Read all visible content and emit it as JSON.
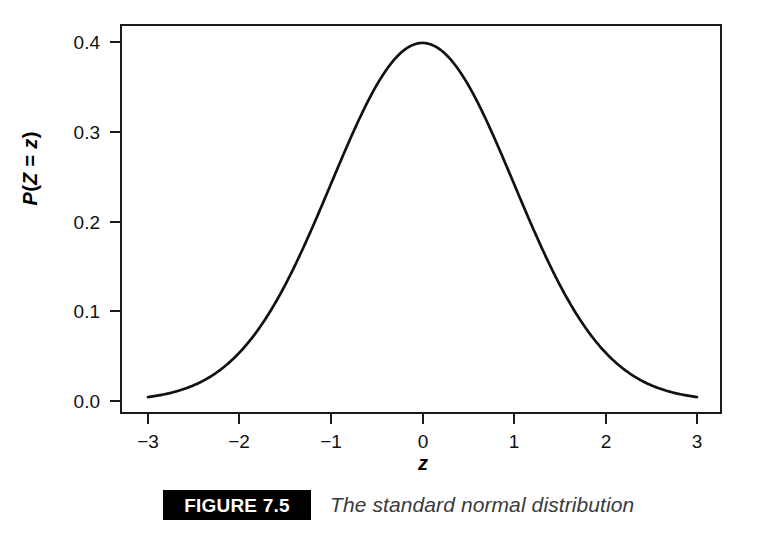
{
  "figure": {
    "badge_label": "FIGURE 7.5",
    "caption": "The standard normal distribution",
    "badge_bg_color": "#000000",
    "badge_text_color": "#ffffff",
    "caption_text_color": "#3b3b3b"
  },
  "axis_titles": {
    "y_parts": {
      "p": "P",
      "open": "(",
      "z_upper": "Z",
      "equals": " = ",
      "z_lower": "z",
      "close": ")"
    },
    "y_full": "P (Z = z)",
    "x": "z"
  },
  "ticks": {
    "y": [
      "0.4",
      "0.3",
      "0.2",
      "0.1",
      "0.0"
    ],
    "x": [
      "−3",
      "−2",
      "−1",
      "0",
      "1",
      "2",
      "3"
    ]
  },
  "chart_data": {
    "type": "line",
    "title": "",
    "subtitle": "",
    "xlabel": "z",
    "ylabel": "P (Z = z)",
    "xlim": [
      -3.25,
      3.25
    ],
    "ylim": [
      -0.013,
      0.4345
    ],
    "xticks": [
      -3,
      -2,
      -1,
      0,
      1,
      2,
      3
    ],
    "xticklabels": [
      "−3",
      "−2",
      "−1",
      "0",
      "1",
      "2",
      "3"
    ],
    "yticks": [
      0.0,
      0.1,
      0.2,
      0.3,
      0.4
    ],
    "yticklabels": [
      "0.0",
      "0.1",
      "0.2",
      "0.3",
      "0.4"
    ],
    "grid": false,
    "legend": null,
    "frame": true,
    "line_color": "#111111",
    "line_width": 2.6,
    "series": [
      {
        "name": "standard normal density",
        "formula": "phi(z) = (1/sqrt(2*pi)) * exp(-z^2/2)",
        "x": [
          -3.0,
          -2.9,
          -2.8,
          -2.7,
          -2.6,
          -2.5,
          -2.4,
          -2.3,
          -2.2,
          -2.1,
          -2.0,
          -1.9,
          -1.8,
          -1.7,
          -1.6,
          -1.5,
          -1.4,
          -1.3,
          -1.2,
          -1.1,
          -1.0,
          -0.9,
          -0.8,
          -0.7,
          -0.6,
          -0.5,
          -0.4,
          -0.3,
          -0.2,
          -0.1,
          0.0,
          0.1,
          0.2,
          0.3,
          0.4,
          0.5,
          0.6,
          0.7,
          0.8,
          0.9,
          1.0,
          1.1,
          1.2,
          1.3,
          1.4,
          1.5,
          1.6,
          1.7,
          1.8,
          1.9,
          2.0,
          2.1,
          2.2,
          2.3,
          2.4,
          2.5,
          2.6,
          2.7,
          2.8,
          2.9,
          3.0
        ],
        "y": [
          0.0044,
          0.006,
          0.0079,
          0.0104,
          0.0136,
          0.0175,
          0.0224,
          0.0283,
          0.0355,
          0.044,
          0.054,
          0.0656,
          0.079,
          0.094,
          0.1109,
          0.1295,
          0.1497,
          0.1714,
          0.1942,
          0.2179,
          0.242,
          0.2661,
          0.2897,
          0.3123,
          0.3332,
          0.3521,
          0.3683,
          0.3814,
          0.391,
          0.397,
          0.3989,
          0.397,
          0.391,
          0.3814,
          0.3683,
          0.3521,
          0.3332,
          0.3123,
          0.2897,
          0.2661,
          0.242,
          0.2179,
          0.1942,
          0.1714,
          0.1497,
          0.1295,
          0.1109,
          0.094,
          0.079,
          0.0656,
          0.054,
          0.044,
          0.0355,
          0.0283,
          0.0224,
          0.0175,
          0.0136,
          0.0104,
          0.0079,
          0.006,
          0.0044
        ],
        "peak": {
          "x": 0,
          "y": 0.3989
        }
      }
    ]
  }
}
